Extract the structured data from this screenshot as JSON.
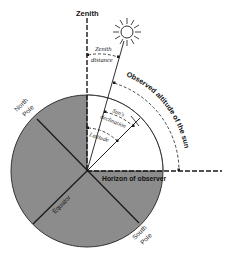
{
  "colors": {
    "earth_fill": "#8c8c8c",
    "line": "#1a1a1a",
    "background": "#ffffff"
  },
  "labels": {
    "zenith": "Zenith",
    "zenith_distance_line1": "Zenith",
    "zenith_distance_line2": "distance",
    "observed_altitude": "Observed altitude of the sun",
    "suns_declination_line1": "Sun's",
    "suns_declination_line2": "declination",
    "latitude": "Latitude",
    "horizon": "Horizon of observer",
    "north_pole_line1": "North",
    "north_pole_line2": "Pole",
    "south_pole_line1": "South",
    "south_pole_line2": "Pole",
    "equator": "Equator"
  },
  "icons": {
    "sun": "sun-icon"
  }
}
